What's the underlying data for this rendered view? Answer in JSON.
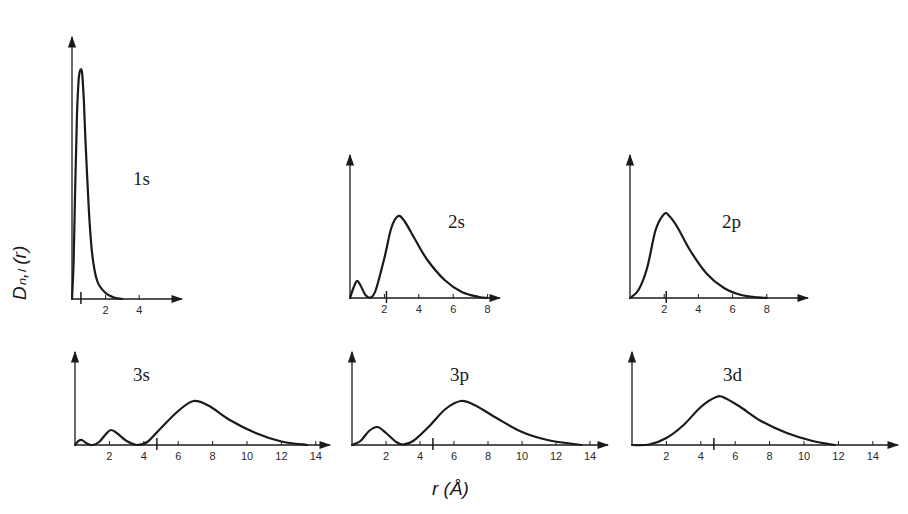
{
  "figure": {
    "ylabel": "Dₙ,ₗ (r)",
    "xlabel": "r (Å)"
  },
  "chart_data": {
    "type": "line",
    "xlabel": "r (Å)",
    "ylabel": "D_{n,l}(r)",
    "grid": false,
    "panels": [
      {
        "name": "1s",
        "origin": [
          72,
          299
        ],
        "px_per_unit": 16.8,
        "ytop": 37,
        "xend": 182,
        "ticks": [
          2,
          4
        ],
        "marker": 0.53,
        "xlim": [
          0,
          6
        ],
        "points": [
          [
            0,
            0
          ],
          [
            0.1,
            40
          ],
          [
            0.2,
            120
          ],
          [
            0.3,
            185
          ],
          [
            0.4,
            220
          ],
          [
            0.5,
            229
          ],
          [
            0.6,
            226
          ],
          [
            0.7,
            200
          ],
          [
            0.8,
            160
          ],
          [
            1.0,
            90
          ],
          [
            1.2,
            45
          ],
          [
            1.5,
            18
          ],
          [
            2.0,
            6
          ],
          [
            2.5,
            1.5
          ],
          [
            3.0,
            0
          ]
        ]
      },
      {
        "name": "2s",
        "origin": [
          350,
          298
        ],
        "px_per_unit": 17.2,
        "ytop": 155,
        "xend": 500,
        "ticks": [
          2,
          4,
          6,
          8
        ],
        "marker": 2.12,
        "xlim": [
          0,
          8.5
        ],
        "points": [
          [
            0,
            0
          ],
          [
            0.2,
            10
          ],
          [
            0.4,
            17
          ],
          [
            0.6,
            13
          ],
          [
            0.9,
            3
          ],
          [
            1.2,
            0.5
          ],
          [
            1.5,
            8
          ],
          [
            2.0,
            40
          ],
          [
            2.4,
            70
          ],
          [
            2.8,
            82
          ],
          [
            3.2,
            76
          ],
          [
            3.8,
            58
          ],
          [
            4.5,
            38
          ],
          [
            5.5,
            18
          ],
          [
            6.5,
            6
          ],
          [
            7.5,
            1
          ],
          [
            8.0,
            0
          ]
        ]
      },
      {
        "name": "2p",
        "origin": [
          630,
          298
        ],
        "px_per_unit": 17.1,
        "ytop": 155,
        "xend": 808,
        "ticks": [
          2,
          4,
          6,
          8
        ],
        "marker": 2.12,
        "xlim": [
          0,
          10
        ],
        "points": [
          [
            0,
            0
          ],
          [
            0.5,
            8
          ],
          [
            1.0,
            30
          ],
          [
            1.5,
            68
          ],
          [
            2.0,
            84
          ],
          [
            2.3,
            82
          ],
          [
            2.8,
            70
          ],
          [
            3.5,
            48
          ],
          [
            4.5,
            24
          ],
          [
            5.5,
            10
          ],
          [
            6.5,
            3
          ],
          [
            7.5,
            0.6
          ],
          [
            8.0,
            0
          ]
        ]
      },
      {
        "name": "3s",
        "origin": [
          75,
          445
        ],
        "px_per_unit": 17.2,
        "ytop": 352,
        "xend": 330,
        "ticks": [
          2,
          4,
          6,
          8,
          10,
          12,
          14
        ],
        "marker": 4.76,
        "xlim": [
          0,
          15
        ],
        "points": [
          [
            0,
            0
          ],
          [
            0.2,
            4
          ],
          [
            0.4,
            5
          ],
          [
            0.7,
            1.5
          ],
          [
            1.0,
            0
          ],
          [
            1.4,
            3
          ],
          [
            1.8,
            11
          ],
          [
            2.1,
            15
          ],
          [
            2.5,
            11
          ],
          [
            3.0,
            4
          ],
          [
            3.6,
            0
          ],
          [
            4.2,
            3
          ],
          [
            5.0,
            17
          ],
          [
            6.0,
            34
          ],
          [
            6.9,
            44
          ],
          [
            7.8,
            39
          ],
          [
            9.0,
            25
          ],
          [
            10.5,
            12
          ],
          [
            12.0,
            3.5
          ],
          [
            13.5,
            0
          ]
        ]
      },
      {
        "name": "3p",
        "origin": [
          352,
          445
        ],
        "px_per_unit": 17.0,
        "ytop": 352,
        "xend": 608,
        "ticks": [
          2,
          4,
          6,
          8,
          10,
          12,
          14
        ],
        "marker": 4.76,
        "xlim": [
          0,
          15
        ],
        "points": [
          [
            0,
            0
          ],
          [
            0.5,
            4
          ],
          [
            1.0,
            14
          ],
          [
            1.5,
            18
          ],
          [
            2.0,
            12
          ],
          [
            2.6,
            3
          ],
          [
            3.0,
            0.5
          ],
          [
            3.6,
            4
          ],
          [
            4.5,
            18
          ],
          [
            5.5,
            36
          ],
          [
            6.4,
            44
          ],
          [
            7.2,
            40
          ],
          [
            8.5,
            27
          ],
          [
            10.0,
            13
          ],
          [
            11.5,
            5
          ],
          [
            13.5,
            0
          ]
        ]
      },
      {
        "name": "3d",
        "origin": [
          632,
          445
        ],
        "px_per_unit": 17.2,
        "ytop": 352,
        "xend": 898,
        "ticks": [
          2,
          4,
          6,
          8,
          10,
          12,
          14
        ],
        "marker": 4.76,
        "xlim": [
          0,
          15
        ],
        "points": [
          [
            0,
            0
          ],
          [
            1.0,
            0.5
          ],
          [
            2.0,
            7
          ],
          [
            3.0,
            20
          ],
          [
            4.0,
            38
          ],
          [
            4.9,
            48
          ],
          [
            5.4,
            47
          ],
          [
            6.3,
            38
          ],
          [
            7.5,
            24
          ],
          [
            9.0,
            12
          ],
          [
            10.5,
            4
          ],
          [
            11.8,
            0
          ]
        ]
      }
    ],
    "label_positions": {
      "1s": [
        133,
        185
      ],
      "2s": [
        448,
        228
      ],
      "2p": [
        722,
        228
      ],
      "3s": [
        133,
        381
      ],
      "3p": [
        450,
        381
      ],
      "3d": [
        723,
        381
      ]
    }
  }
}
